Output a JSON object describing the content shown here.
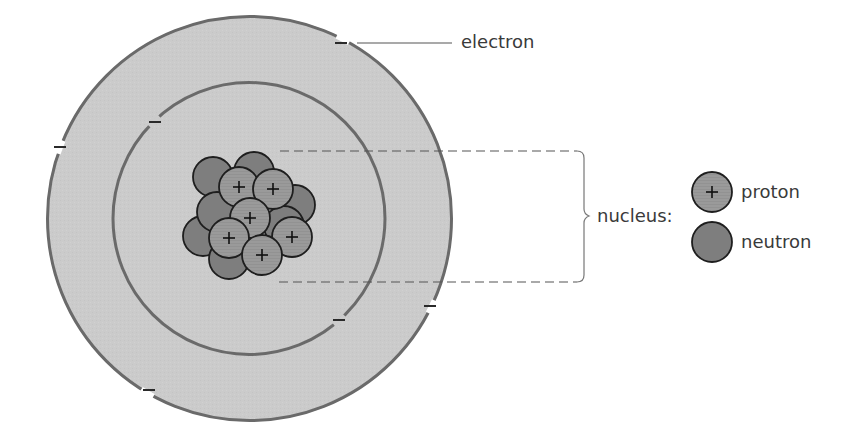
{
  "diagram": {
    "type": "atom-model",
    "colors": {
      "background": "#ffffff",
      "atom_fill": "#cbcbcb",
      "shell_stroke": "#6a6a6a",
      "proton_fill": "#9a9a9a",
      "neutron_fill": "#7e7e7e",
      "particle_stroke": "#1e1e1e",
      "electron_mark": "#2a2a2a",
      "guide_line": "#555555",
      "label_text": "#3a3a3a"
    },
    "atom": {
      "cx": 249.5,
      "cy": 218.5,
      "outer_radius": 203,
      "inner_radius": 136
    },
    "electrons": [
      {
        "shell": "outer",
        "x": 341,
        "y": 43
      },
      {
        "shell": "outer",
        "x": 60,
        "y": 147
      },
      {
        "shell": "outer",
        "x": 430,
        "y": 306
      },
      {
        "shell": "outer",
        "x": 149,
        "y": 390
      },
      {
        "shell": "inner",
        "x": 155,
        "y": 122
      },
      {
        "shell": "inner",
        "x": 339,
        "y": 320
      }
    ],
    "nucleus_particles": [
      {
        "kind": "neutron",
        "x": 254,
        "y": 172
      },
      {
        "kind": "neutron",
        "x": 213,
        "y": 177
      },
      {
        "kind": "neutron",
        "x": 295,
        "y": 205
      },
      {
        "kind": "neutron",
        "x": 203,
        "y": 236
      },
      {
        "kind": "neutron",
        "x": 284,
        "y": 226
      },
      {
        "kind": "neutron",
        "x": 229,
        "y": 259
      },
      {
        "kind": "neutron",
        "x": 217,
        "y": 212
      },
      {
        "kind": "proton",
        "x": 239,
        "y": 187
      },
      {
        "kind": "proton",
        "x": 273,
        "y": 189
      },
      {
        "kind": "proton",
        "x": 250,
        "y": 218
      },
      {
        "kind": "proton",
        "x": 229,
        "y": 238
      },
      {
        "kind": "proton",
        "x": 292,
        "y": 237
      },
      {
        "kind": "proton",
        "x": 262,
        "y": 255
      }
    ],
    "labels": {
      "electron": "electron",
      "nucleus": "nucleus:",
      "proton": "proton",
      "neutron": "neutron"
    },
    "symbols": {
      "proton_sign": "+",
      "electron_sign": "–"
    },
    "legend": [
      {
        "kind": "proton",
        "label": "proton"
      },
      {
        "kind": "neutron",
        "label": "neutron"
      }
    ]
  }
}
